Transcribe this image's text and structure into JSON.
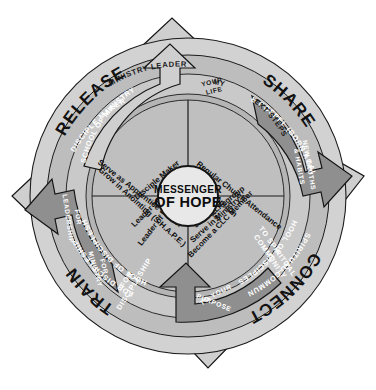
{
  "diagram": {
    "hub": {
      "line1": "MESSENGER",
      "line2": "OF HOPE"
    },
    "colors": {
      "background": "#ffffff",
      "ring_outer": "#d2d2d2",
      "ring_second": "#bdbdbd",
      "ring_third": "#c9c9c9",
      "ring_inner": "#b5b5b5",
      "hub": "#e8e8e8",
      "arrow_light": "#cfcfcf",
      "arrow_dark": "#8f8f8f",
      "stroke": "#1b1b1b",
      "text_light": "#ffffff",
      "text_dark": "#111111"
    },
    "quadrants": [
      {
        "id": "share",
        "name": "SHARE",
        "position": "top-right",
        "ring_second": "THE GOSPEL (BORN AGAIN)",
        "ring_third": "MY NEXT STEPS",
        "ring_third_part_a": "MY",
        "ring_third_part_b": "EXT STEPS",
        "arrow_label": "YOUR LIFE",
        "arrow_label_line1": "YOUR",
        "arrow_label_line2": "LIFE",
        "items": [
          "Regular Church Attendance",
          "Water Baptism",
          "Encounter"
        ]
      },
      {
        "id": "connect",
        "name": "CONNECT",
        "position": "bottom-right",
        "ring_second": "TO SPIRITUAL COMMUNITY",
        "ring_second_line1": "TO SPIRITUAL",
        "ring_second_line2": "COMMUNITY",
        "ring_third": "SCHOOL OF DISCIPLESHIP",
        "arrow_label": "TO YOUR PURPOSE",
        "arrow_label_line1": "TO YOUR",
        "arrow_label_line2": "PURPOSE",
        "items": [
          "Join a Lifegroup",
          "Serve in Ministry",
          "Become a CLC Member"
        ]
      },
      {
        "id": "train",
        "name": "TRAIN",
        "position": "bottom-left",
        "ring_second": "FOR DISCIPLESHIP",
        "ring_second_line1": "FOR",
        "ring_second_line2": "DISCIPLESHIP",
        "ring_third": "SCHOOL OF DISCIPLESHIP",
        "arrow_label": "FOR MINISTRY",
        "arrow_label_line1": "FOR",
        "arrow_label_line2": "MINISTRY",
        "items": [
          "Serve as Apprentice Leader",
          "Grow in Anointing (S.H.A.P.E.)"
        ]
      },
      {
        "id": "release",
        "name": "RELEASE",
        "position": "top-left",
        "ring_second": "DISCIPLE MAKER",
        "ring_third": "SCHOOL OF MINISTRY",
        "arrow_label": "MINISTRY LEADER",
        "items": [
          "Disciple Maker",
          "Leader in Ministry",
          "Leader of Leaders"
        ]
      }
    ],
    "arrows": [
      {
        "id": "top-arrow",
        "label": "MINISTRY LEADER",
        "style": "light"
      },
      {
        "id": "right-arrow",
        "label": "NEW TRUTHS & HABITS",
        "style": "dark",
        "label_line1": "NEW TRUTHS",
        "label_line2": "& HABITS"
      },
      {
        "id": "bottom-arrow",
        "label": "TO YOUR PURPOSE",
        "style": "dark"
      },
      {
        "id": "left-arrow",
        "label": "FOR LEADERSHIP",
        "style": "dark",
        "label_line1": "FOR",
        "label_line2": "LEADERSHIP"
      }
    ]
  }
}
